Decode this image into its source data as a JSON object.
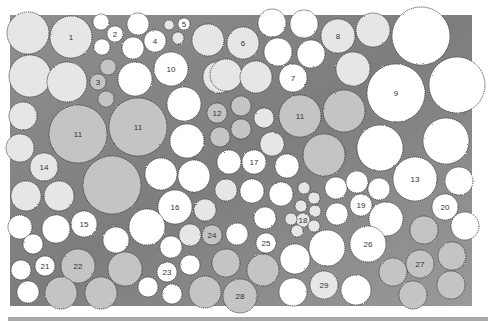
{
  "diagram": {
    "type": "planting-plan",
    "colors": {
      "bed": "#8c8c8c",
      "bed_light": "#a6a6a6",
      "white_plant": "#ffffff",
      "light_plant": "#e6e6e6",
      "mid_plant": "#c4c4c4",
      "outline": "#3a3a3a"
    },
    "bed": {
      "x": 10,
      "y": 15,
      "w": 462,
      "h": 291
    },
    "plants": [
      {
        "label": "",
        "cx": 28,
        "cy": 33,
        "r": 21,
        "tone": "light"
      },
      {
        "label": "1",
        "cx": 71,
        "cy": 37,
        "r": 21,
        "tone": "light"
      },
      {
        "label": "",
        "cx": 101,
        "cy": 22,
        "r": 8,
        "tone": "white"
      },
      {
        "label": "2",
        "cx": 115,
        "cy": 34,
        "r": 8,
        "tone": "white"
      },
      {
        "label": "",
        "cx": 102,
        "cy": 47,
        "r": 8,
        "tone": "white"
      },
      {
        "label": "",
        "cx": 138,
        "cy": 24,
        "r": 11,
        "tone": "white"
      },
      {
        "label": "4",
        "cx": 155,
        "cy": 41,
        "r": 11,
        "tone": "white"
      },
      {
        "label": "",
        "cx": 133,
        "cy": 48,
        "r": 11,
        "tone": "white"
      },
      {
        "label": "",
        "cx": 169,
        "cy": 25,
        "r": 5,
        "tone": "light"
      },
      {
        "label": "5",
        "cx": 184,
        "cy": 24,
        "r": 6,
        "tone": "white"
      },
      {
        "label": "",
        "cx": 178,
        "cy": 38,
        "r": 6,
        "tone": "light"
      },
      {
        "label": "",
        "cx": 208,
        "cy": 40,
        "r": 16,
        "tone": "light"
      },
      {
        "label": "",
        "cx": 30,
        "cy": 76,
        "r": 21,
        "tone": "light"
      },
      {
        "label": "",
        "cx": 67,
        "cy": 82,
        "r": 20,
        "tone": "light"
      },
      {
        "label": "",
        "cx": 108,
        "cy": 67,
        "r": 8,
        "tone": "mid"
      },
      {
        "label": "3",
        "cx": 98,
        "cy": 82,
        "r": 8,
        "tone": "mid"
      },
      {
        "label": "",
        "cx": 106,
        "cy": 99,
        "r": 8,
        "tone": "mid"
      },
      {
        "label": "",
        "cx": 135,
        "cy": 79,
        "r": 17,
        "tone": "white"
      },
      {
        "label": "10",
        "cx": 171,
        "cy": 69,
        "r": 17,
        "tone": "white"
      },
      {
        "label": "",
        "cx": 184,
        "cy": 104,
        "r": 17,
        "tone": "white"
      },
      {
        "label": "",
        "cx": 23,
        "cy": 116,
        "r": 14,
        "tone": "light"
      },
      {
        "label": "11",
        "cx": 78,
        "cy": 134,
        "r": 29,
        "tone": "mid"
      },
      {
        "label": "11",
        "cx": 138,
        "cy": 127,
        "r": 29,
        "tone": "mid"
      },
      {
        "label": "",
        "cx": 187,
        "cy": 141,
        "r": 17,
        "tone": "white"
      },
      {
        "label": "",
        "cx": 219,
        "cy": 77,
        "r": 16,
        "tone": "light"
      },
      {
        "label": "6",
        "cx": 243,
        "cy": 43,
        "r": 16,
        "tone": "light"
      },
      {
        "label": "",
        "cx": 272,
        "cy": 23,
        "r": 14,
        "tone": "white"
      },
      {
        "label": "",
        "cx": 304,
        "cy": 24,
        "r": 14,
        "tone": "white"
      },
      {
        "label": "",
        "cx": 278,
        "cy": 52,
        "r": 14,
        "tone": "white"
      },
      {
        "label": "",
        "cx": 311,
        "cy": 54,
        "r": 14,
        "tone": "white"
      },
      {
        "label": "",
        "cx": 226,
        "cy": 75,
        "r": 16,
        "tone": "light"
      },
      {
        "label": "",
        "cx": 256,
        "cy": 77,
        "r": 16,
        "tone": "light"
      },
      {
        "label": "7",
        "cx": 293,
        "cy": 78,
        "r": 14,
        "tone": "white"
      },
      {
        "label": "8",
        "cx": 338,
        "cy": 36,
        "r": 17,
        "tone": "light"
      },
      {
        "label": "",
        "cx": 373,
        "cy": 30,
        "r": 17,
        "tone": "light"
      },
      {
        "label": "",
        "cx": 421,
        "cy": 36,
        "r": 29,
        "tone": "white"
      },
      {
        "label": "",
        "cx": 353,
        "cy": 69,
        "r": 17,
        "tone": "light"
      },
      {
        "label": "9",
        "cx": 396,
        "cy": 93,
        "r": 29,
        "tone": "white"
      },
      {
        "label": "",
        "cx": 457,
        "cy": 85,
        "r": 28,
        "tone": "white"
      },
      {
        "label": "12",
        "cx": 217,
        "cy": 113,
        "r": 10,
        "tone": "mid"
      },
      {
        "label": "",
        "cx": 241,
        "cy": 106,
        "r": 10,
        "tone": "mid"
      },
      {
        "label": "",
        "cx": 220,
        "cy": 137,
        "r": 10,
        "tone": "mid"
      },
      {
        "label": "",
        "cx": 241,
        "cy": 129,
        "r": 10,
        "tone": "mid"
      },
      {
        "label": "",
        "cx": 264,
        "cy": 118,
        "r": 10,
        "tone": "light"
      },
      {
        "label": "11",
        "cx": 300,
        "cy": 116,
        "r": 21,
        "tone": "mid"
      },
      {
        "label": "",
        "cx": 344,
        "cy": 111,
        "r": 21,
        "tone": "mid"
      },
      {
        "label": "",
        "cx": 272,
        "cy": 144,
        "r": 12,
        "tone": "light"
      },
      {
        "label": "",
        "cx": 380,
        "cy": 148,
        "r": 23,
        "tone": "white"
      },
      {
        "label": "",
        "cx": 446,
        "cy": 141,
        "r": 23,
        "tone": "white"
      },
      {
        "label": "",
        "cx": 324,
        "cy": 155,
        "r": 21,
        "tone": "mid"
      },
      {
        "label": "",
        "cx": 20,
        "cy": 148,
        "r": 14,
        "tone": "light"
      },
      {
        "label": "14",
        "cx": 44,
        "cy": 167,
        "r": 14,
        "tone": "light"
      },
      {
        "label": "",
        "cx": 26,
        "cy": 196,
        "r": 15,
        "tone": "light"
      },
      {
        "label": "",
        "cx": 59,
        "cy": 196,
        "r": 15,
        "tone": "light"
      },
      {
        "label": "",
        "cx": 112,
        "cy": 185,
        "r": 29,
        "tone": "mid"
      },
      {
        "label": "",
        "cx": 161,
        "cy": 174,
        "r": 16,
        "tone": "white"
      },
      {
        "label": "",
        "cx": 194,
        "cy": 176,
        "r": 16,
        "tone": "white"
      },
      {
        "label": "",
        "cx": 229,
        "cy": 162,
        "r": 12,
        "tone": "white"
      },
      {
        "label": "17",
        "cx": 254,
        "cy": 162,
        "r": 12,
        "tone": "white"
      },
      {
        "label": "",
        "cx": 287,
        "cy": 166,
        "r": 12,
        "tone": "white"
      },
      {
        "label": "16",
        "cx": 175,
        "cy": 207,
        "r": 17,
        "tone": "white"
      },
      {
        "label": "",
        "cx": 205,
        "cy": 210,
        "r": 11,
        "tone": "light"
      },
      {
        "label": "",
        "cx": 226,
        "cy": 190,
        "r": 11,
        "tone": "light"
      },
      {
        "label": "",
        "cx": 252,
        "cy": 191,
        "r": 12,
        "tone": "white"
      },
      {
        "label": "",
        "cx": 281,
        "cy": 194,
        "r": 12,
        "tone": "white"
      },
      {
        "label": "",
        "cx": 304,
        "cy": 188,
        "r": 6,
        "tone": "light"
      },
      {
        "label": "",
        "cx": 314,
        "cy": 198,
        "r": 6,
        "tone": "light"
      },
      {
        "label": "",
        "cx": 301,
        "cy": 206,
        "r": 6,
        "tone": "light"
      },
      {
        "label": "18",
        "cx": 303,
        "cy": 220,
        "r": 7,
        "tone": "light"
      },
      {
        "label": "",
        "cx": 315,
        "cy": 211,
        "r": 6,
        "tone": "light"
      },
      {
        "label": "",
        "cx": 314,
        "cy": 226,
        "r": 6,
        "tone": "light"
      },
      {
        "label": "",
        "cx": 291,
        "cy": 219,
        "r": 6,
        "tone": "light"
      },
      {
        "label": "",
        "cx": 297,
        "cy": 231,
        "r": 6,
        "tone": "light"
      },
      {
        "label": "",
        "cx": 336,
        "cy": 188,
        "r": 11,
        "tone": "white"
      },
      {
        "label": "",
        "cx": 357,
        "cy": 182,
        "r": 11,
        "tone": "white"
      },
      {
        "label": "",
        "cx": 379,
        "cy": 189,
        "r": 11,
        "tone": "white"
      },
      {
        "label": "19",
        "cx": 361,
        "cy": 205,
        "r": 11,
        "tone": "white"
      },
      {
        "label": "",
        "cx": 337,
        "cy": 214,
        "r": 11,
        "tone": "white"
      },
      {
        "label": "13",
        "cx": 415,
        "cy": 179,
        "r": 22,
        "tone": "white"
      },
      {
        "label": "",
        "cx": 459,
        "cy": 181,
        "r": 14,
        "tone": "white"
      },
      {
        "label": "20",
        "cx": 445,
        "cy": 207,
        "r": 13,
        "tone": "white"
      },
      {
        "label": "",
        "cx": 465,
        "cy": 226,
        "r": 14,
        "tone": "white"
      },
      {
        "label": "",
        "cx": 386,
        "cy": 219,
        "r": 17,
        "tone": "white"
      },
      {
        "label": "",
        "cx": 20,
        "cy": 227,
        "r": 12,
        "tone": "white"
      },
      {
        "label": "",
        "cx": 56,
        "cy": 229,
        "r": 14,
        "tone": "white"
      },
      {
        "label": "15",
        "cx": 84,
        "cy": 224,
        "r": 13,
        "tone": "white"
      },
      {
        "label": "",
        "cx": 116,
        "cy": 240,
        "r": 13,
        "tone": "white"
      },
      {
        "label": "",
        "cx": 33,
        "cy": 244,
        "r": 10,
        "tone": "white"
      },
      {
        "label": "",
        "cx": 147,
        "cy": 227,
        "r": 18,
        "tone": "white"
      },
      {
        "label": "",
        "cx": 171,
        "cy": 247,
        "r": 11,
        "tone": "white"
      },
      {
        "label": "",
        "cx": 190,
        "cy": 235,
        "r": 11,
        "tone": "light"
      },
      {
        "label": "24",
        "cx": 212,
        "cy": 235,
        "r": 10,
        "tone": "mid"
      },
      {
        "label": "",
        "cx": 237,
        "cy": 234,
        "r": 11,
        "tone": "white"
      },
      {
        "label": "",
        "cx": 265,
        "cy": 218,
        "r": 11,
        "tone": "white"
      },
      {
        "label": "25",
        "cx": 266,
        "cy": 243,
        "r": 10,
        "tone": "white"
      },
      {
        "label": "",
        "cx": 295,
        "cy": 259,
        "r": 15,
        "tone": "white"
      },
      {
        "label": "",
        "cx": 327,
        "cy": 248,
        "r": 18,
        "tone": "white"
      },
      {
        "label": "26",
        "cx": 368,
        "cy": 244,
        "r": 18,
        "tone": "white"
      },
      {
        "label": "",
        "cx": 424,
        "cy": 230,
        "r": 14,
        "tone": "mid"
      },
      {
        "label": "27",
        "cx": 420,
        "cy": 264,
        "r": 14,
        "tone": "mid"
      },
      {
        "label": "",
        "cx": 452,
        "cy": 256,
        "r": 14,
        "tone": "mid"
      },
      {
        "label": "",
        "cx": 21,
        "cy": 270,
        "r": 10,
        "tone": "white"
      },
      {
        "label": "21",
        "cx": 45,
        "cy": 266,
        "r": 10,
        "tone": "white"
      },
      {
        "label": "22",
        "cx": 78,
        "cy": 266,
        "r": 17,
        "tone": "mid"
      },
      {
        "label": "",
        "cx": 125,
        "cy": 269,
        "r": 17,
        "tone": "mid"
      },
      {
        "label": "23",
        "cx": 167,
        "cy": 272,
        "r": 10,
        "tone": "white"
      },
      {
        "label": "",
        "cx": 190,
        "cy": 265,
        "r": 10,
        "tone": "white"
      },
      {
        "label": "",
        "cx": 226,
        "cy": 263,
        "r": 14,
        "tone": "mid"
      },
      {
        "label": "",
        "cx": 263,
        "cy": 270,
        "r": 16,
        "tone": "mid"
      },
      {
        "label": "",
        "cx": 393,
        "cy": 272,
        "r": 14,
        "tone": "mid"
      },
      {
        "label": "",
        "cx": 28,
        "cy": 292,
        "r": 11,
        "tone": "white"
      },
      {
        "label": "",
        "cx": 61,
        "cy": 293,
        "r": 16,
        "tone": "mid"
      },
      {
        "label": "",
        "cx": 101,
        "cy": 293,
        "r": 16,
        "tone": "mid"
      },
      {
        "label": "",
        "cx": 148,
        "cy": 287,
        "r": 10,
        "tone": "white"
      },
      {
        "label": "",
        "cx": 172,
        "cy": 294,
        "r": 10,
        "tone": "white"
      },
      {
        "label": "",
        "cx": 205,
        "cy": 292,
        "r": 16,
        "tone": "mid"
      },
      {
        "label": "28",
        "cx": 240,
        "cy": 296,
        "r": 17,
        "tone": "mid"
      },
      {
        "label": "",
        "cx": 293,
        "cy": 292,
        "r": 14,
        "tone": "white"
      },
      {
        "label": "29",
        "cx": 324,
        "cy": 285,
        "r": 14,
        "tone": "light"
      },
      {
        "label": "",
        "cx": 356,
        "cy": 290,
        "r": 15,
        "tone": "white"
      },
      {
        "label": "",
        "cx": 413,
        "cy": 295,
        "r": 14,
        "tone": "mid"
      },
      {
        "label": "",
        "cx": 451,
        "cy": 285,
        "r": 14,
        "tone": "mid"
      }
    ]
  },
  "header_text": ""
}
